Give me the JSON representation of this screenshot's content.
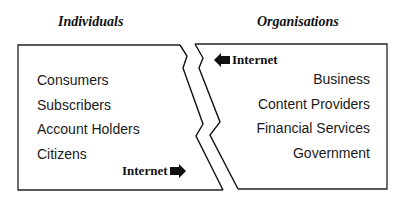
{
  "headings": {
    "left": "Individuals",
    "right": "Organisations"
  },
  "individuals": [
    "Consumers",
    "Subscribers",
    "Account Holders",
    "Citizens"
  ],
  "organisations": [
    "Business",
    "Content Providers",
    "Financial Services",
    "Government"
  ],
  "internet_left_to_right": {
    "label": "Internet",
    "icon": "arrow-right-icon"
  },
  "internet_right_to_left": {
    "label": "Internet",
    "icon": "arrow-left-icon"
  }
}
